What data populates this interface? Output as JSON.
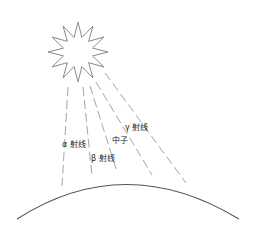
{
  "diagram": {
    "title": "",
    "sun": {
      "icon": "sun-star-icon",
      "center": [
        78,
        52
      ],
      "points": 12,
      "outer_radius": 30,
      "inner_radius": 15,
      "stroke": "#8a8a8a"
    },
    "rays": [
      {
        "name": "alpha-ray",
        "from": [
          68,
          87
        ],
        "to": [
          62,
          186
        ]
      },
      {
        "name": "beta-ray",
        "from": [
          83,
          87
        ],
        "to": [
          92,
          176
        ]
      },
      {
        "name": "neutron-ray",
        "from": [
          90,
          86
        ],
        "to": [
          117,
          172
        ]
      },
      {
        "name": "gamma-ray",
        "from": [
          96,
          82
        ],
        "to": [
          152,
          175
        ]
      },
      {
        "name": "extra-ray",
        "from": [
          105,
          73
        ],
        "to": [
          186,
          183
        ]
      }
    ],
    "ray_stroke": "#9a9a9a",
    "labels": {
      "alpha": "α 射线",
      "beta": "β 射线",
      "neutron": "中子",
      "gamma": "γ 射线"
    },
    "earth": {
      "icon": "earth-surface-arc",
      "start": [
        17,
        219
      ],
      "control": [
        125,
        150
      ],
      "end": [
        239,
        219
      ],
      "stroke": "#555555"
    }
  }
}
